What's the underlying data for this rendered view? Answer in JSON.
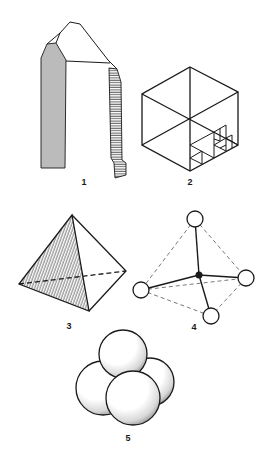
{
  "figure": {
    "background": "#ffffff",
    "ink_color": "#1a1a1a",
    "panels": [
      {
        "id": 1,
        "label": "1",
        "subject": "quartz-crystal",
        "label_pos": [
          84,
          178
        ]
      },
      {
        "id": 2,
        "label": "2",
        "subject": "hexagon-cube-with-recursive-triangles",
        "label_pos": [
          190,
          178
        ]
      },
      {
        "id": 3,
        "label": "3",
        "subject": "tetrahedron-with-hatched-face",
        "label_pos": [
          69,
          322
        ]
      },
      {
        "id": 4,
        "label": "4",
        "subject": "tetrahedral-ball-and-stick-model",
        "label_pos": [
          194,
          323
        ]
      },
      {
        "id": 5,
        "label": "5",
        "subject": "four-packed-spheres",
        "label_pos": [
          128,
          434
        ]
      }
    ]
  }
}
